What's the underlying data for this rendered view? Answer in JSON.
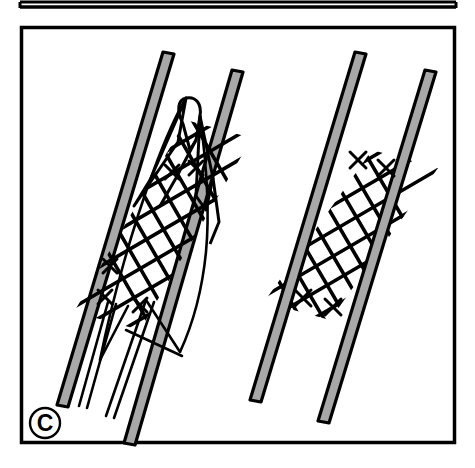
{
  "figure": {
    "domain_kind": "anatomical-line-diagram",
    "panel_label": "C",
    "caption_visible": "",
    "background_color": "#ffffff",
    "outline_color": "#000000",
    "vessel_wall_fill": "#a8a8a8",
    "stent_mesh_color": "#000000",
    "panel_border_color": "#000000"
  },
  "upper_panel": {
    "name": "upper-panel-fragment",
    "visible_portion": "bottom border only",
    "border_color": "#000000",
    "left": 20,
    "right": 456,
    "bottom_y": 7
  },
  "main_panel": {
    "name": "panel-c",
    "left": 20,
    "top": 26,
    "right": 456,
    "bottom": 444,
    "border_width": 3,
    "border_color": "#000000",
    "fill": "#ffffff"
  },
  "label_badge": {
    "text": "C",
    "shape": "circle",
    "center_x": 45,
    "center_y": 423,
    "radius": 15,
    "stroke": "#000000",
    "fill": "#ffffff",
    "text_color": "#000000"
  },
  "scenes": [
    {
      "id": "left-scene",
      "name": "partially-deployed-stent",
      "description": "Stent partially released from delivery catheter inside vessel; tapered cone tip at proximal end, diamond lattice mesh body, delivery catheter shafts extending distally.",
      "vessel": {
        "name": "vessel-left",
        "tilt_degrees": 12,
        "walls": [
          {
            "name": "vessel-left-wall-left",
            "x_top": 163,
            "y_top": 52,
            "x_bottom": 58,
            "y_bottom": 405,
            "thickness": 11
          },
          {
            "name": "vessel-left-wall-right",
            "x_top": 232,
            "y_top": 70,
            "x_bottom": 124,
            "y_bottom": 443,
            "thickness": 11
          }
        ]
      },
      "stent": {
        "name": "stent-partial",
        "mesh_rows": 9,
        "mesh_cols": 6,
        "has_tapered_tip": true,
        "has_crossing_end_marks": true,
        "catheter_shaft_count": 3
      }
    },
    {
      "id": "right-scene",
      "name": "fully-deployed-stent",
      "description": "Stent fully expanded and apposed to vessel wall; uniform diamond lattice cylinder with crossing end marks at both ends.",
      "vessel": {
        "name": "vessel-right",
        "tilt_degrees": 12,
        "walls": [
          {
            "name": "vessel-right-wall-left",
            "x_top": 355,
            "y_top": 52,
            "x_bottom": 250,
            "y_bottom": 400,
            "thickness": 11
          },
          {
            "name": "vessel-right-wall-right",
            "x_top": 425,
            "y_top": 70,
            "x_bottom": 318,
            "y_bottom": 421,
            "thickness": 11
          }
        ]
      },
      "stent": {
        "name": "stent-deployed",
        "mesh_rows": 8,
        "mesh_cols": 6,
        "has_tapered_tip": false,
        "has_crossing_end_marks": true,
        "catheter_shaft_count": 0
      }
    }
  ]
}
